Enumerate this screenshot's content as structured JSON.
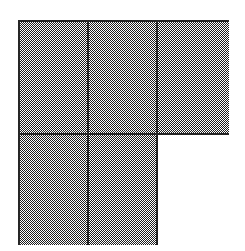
{
  "figure": {
    "type": "fraction-area-model",
    "background_color": "#ffffff",
    "line_color": "#262626",
    "shaded_color": "#808080",
    "unshaded_color": "#ffffff",
    "line_width_px": 2,
    "bounds": {
      "x": 18,
      "y": 20,
      "width": 211,
      "height": 225
    },
    "grid": {
      "columns": 3,
      "rows": 2,
      "total_cells": 6,
      "shaded_cells": 5,
      "unshaded_cells": 1,
      "fraction_shaded": "5/6",
      "column_widths_px": [
        67,
        67,
        71
      ],
      "row_heights_px": [
        111,
        110
      ],
      "vertical_divider_x": [
        87,
        157
      ],
      "horizontal_divider_y": [
        133
      ]
    },
    "cells": [
      {
        "id": "cell-r1c1",
        "row": 1,
        "column": 1,
        "state": "shaded"
      },
      {
        "id": "cell-r1c2",
        "row": 1,
        "column": 2,
        "state": "shaded"
      },
      {
        "id": "cell-r1c3",
        "row": 1,
        "column": 3,
        "state": "shaded"
      },
      {
        "id": "cell-r2c1",
        "row": 2,
        "column": 1,
        "state": "shaded"
      },
      {
        "id": "cell-r2c2",
        "row": 2,
        "column": 2,
        "state": "shaded"
      },
      {
        "id": "cell-r2c3",
        "row": 2,
        "column": 3,
        "state": "unshaded"
      }
    ]
  }
}
